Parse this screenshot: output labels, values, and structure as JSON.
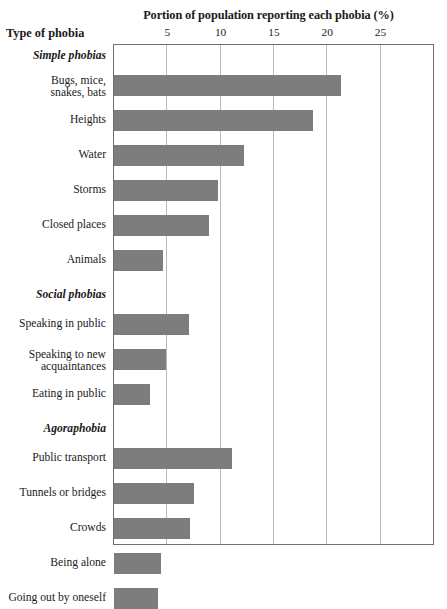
{
  "chart_data": {
    "type": "bar",
    "orientation": "horizontal",
    "title": "Portion of population reporting each phobia (%)",
    "xlabel": "",
    "ylabel": "Type of phobia",
    "xlim": [
      0,
      27.8
    ],
    "xticks": [
      5,
      10,
      15,
      20,
      25
    ],
    "grid": true,
    "legend": false,
    "bar_color": "#7d7d7d",
    "frame_color": "#6f6f6f",
    "gridline_color": "#b9b9b9",
    "groups": [
      {
        "name": "Simple phobias",
        "categories": [
          "Bugs, mice,\nsnakes, bats",
          "Heights",
          "Water",
          "Storms",
          "Closed places",
          "Animals"
        ],
        "values": [
          21.3,
          18.7,
          12.2,
          9.8,
          8.9,
          4.6
        ]
      },
      {
        "name": "Social phobias",
        "categories": [
          "Speaking in public",
          "Speaking to new\nacquaintances",
          "Eating in public"
        ],
        "values": [
          7.0,
          4.9,
          3.4
        ]
      },
      {
        "name": "Agoraphobia",
        "categories": [
          "Public transport",
          "Tunnels or bridges",
          "Crowds",
          "Being alone",
          "Going out by oneself"
        ],
        "values": [
          11.1,
          7.5,
          7.1,
          4.4,
          4.1
        ]
      }
    ],
    "categories": [
      "Bugs, mice,\nsnakes, bats",
      "Heights",
      "Water",
      "Storms",
      "Closed places",
      "Animals",
      "Speaking in public",
      "Speaking to new\nacquaintances",
      "Eating in public",
      "Public transport",
      "Tunnels or bridges",
      "Crowds",
      "Being alone",
      "Going out by oneself"
    ],
    "values": [
      21.3,
      18.7,
      12.2,
      9.8,
      8.9,
      4.6,
      7.0,
      4.9,
      3.4,
      11.1,
      7.5,
      7.1,
      4.4,
      4.1
    ]
  },
  "rows": [
    {
      "label": "Simple phobias",
      "group": true,
      "value": null
    },
    {
      "label": "Bugs, mice,\nsnakes, bats",
      "group": false,
      "value": 21.3
    },
    {
      "label": "Heights",
      "group": false,
      "value": 18.7
    },
    {
      "label": "Water",
      "group": false,
      "value": 12.2
    },
    {
      "label": "Storms",
      "group": false,
      "value": 9.8
    },
    {
      "label": "Closed places",
      "group": false,
      "value": 8.9
    },
    {
      "label": "Animals",
      "group": false,
      "value": 4.6
    },
    {
      "label": "Social phobias",
      "group": true,
      "value": null
    },
    {
      "label": "Speaking in public",
      "group": false,
      "value": 7.0
    },
    {
      "label": "Speaking to new\nacquaintances",
      "group": false,
      "value": 4.9
    },
    {
      "label": "Eating in public",
      "group": false,
      "value": 3.4
    },
    {
      "label": "Agoraphobia",
      "group": true,
      "value": null
    },
    {
      "label": "Public transport",
      "group": false,
      "value": 11.1
    },
    {
      "label": "Tunnels or bridges",
      "group": false,
      "value": 7.5
    },
    {
      "label": "Crowds",
      "group": false,
      "value": 7.1
    },
    {
      "label": "Being alone",
      "group": false,
      "value": 4.4
    },
    {
      "label": "Going out by oneself",
      "group": false,
      "value": 4.1
    }
  ],
  "ticks": [
    {
      "label": "5"
    },
    {
      "label": "10"
    },
    {
      "label": "15"
    },
    {
      "label": "20"
    },
    {
      "label": "25"
    }
  ]
}
